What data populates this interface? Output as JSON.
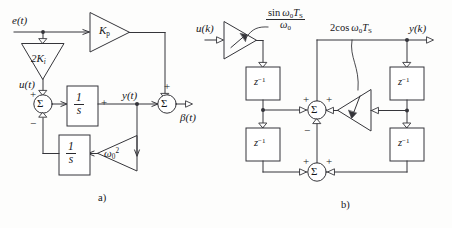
{
  "figure": {
    "caption_a": "a)",
    "caption_b": "b)"
  },
  "diagram_a": {
    "title": "Continuous-time resonant controller block diagram",
    "inputs": [
      {
        "name": "error-input",
        "label": "e(t)"
      }
    ],
    "internal_signals": [
      {
        "name": "u-signal",
        "label": "u(t)"
      },
      {
        "name": "y-signal",
        "label": "y(t)"
      }
    ],
    "outputs": [
      {
        "name": "beta-output",
        "label": "β(t)"
      }
    ],
    "gains": [
      {
        "name": "gain-2ki",
        "label_main": "2K",
        "label_sub": "i",
        "orientation": "down"
      },
      {
        "name": "gain-kp",
        "label_main": "K",
        "label_sub": "p",
        "orientation": "right"
      },
      {
        "name": "gain-omega0-squared",
        "label_main": "ω",
        "label_sub": "0",
        "label_sup": "2",
        "orientation": "left"
      }
    ],
    "blocks": [
      {
        "name": "integrator-forward",
        "num": "1",
        "den": "s"
      },
      {
        "name": "integrator-feedback",
        "num": "1",
        "den": "s"
      }
    ],
    "summing_junctions": [
      {
        "name": "sum-junction-left",
        "symbol": "Σ",
        "signs": {
          "top": "+",
          "bottom": "−"
        }
      },
      {
        "name": "sum-junction-right",
        "symbol": "Σ",
        "signs": {
          "top": "+",
          "left": "+"
        }
      }
    ]
  },
  "diagram_b": {
    "title": "Discrete-time resonant (Goertzel-type) block diagram",
    "inputs": [
      {
        "name": "uk-input",
        "label": "u(k)"
      }
    ],
    "outputs": [
      {
        "name": "yk-output",
        "label": "y(k)"
      }
    ],
    "annotations": [
      {
        "name": "gain-sin-annotation",
        "numerator_sin": "sin",
        "numerator_omega": "ω",
        "numerator_omega_sub": "0",
        "numerator_T": "T",
        "numerator_T_sub": "S",
        "denominator_omega": "ω",
        "denominator_omega_sub": "0"
      },
      {
        "name": "gain-cos-annotation",
        "text_lead": "2cos",
        "text_omega": "ω",
        "text_omega_sub": "0",
        "text_T": "T",
        "text_T_sub": "S"
      }
    ],
    "delay_blocks": [
      {
        "name": "delay-left-upper",
        "label_main": "z",
        "label_sup": "−1"
      },
      {
        "name": "delay-left-lower",
        "label_main": "z",
        "label_sup": "−1"
      },
      {
        "name": "delay-right-upper",
        "label_main": "z",
        "label_sup": "−1"
      },
      {
        "name": "delay-right-lower",
        "label_main": "z",
        "label_sup": "−1"
      }
    ],
    "gains": [
      {
        "name": "gain-input-sin",
        "orientation": "right",
        "variable": true
      },
      {
        "name": "gain-feedback-cos",
        "orientation": "left",
        "variable": true
      }
    ],
    "summing_junctions": [
      {
        "name": "sum-junction-upper",
        "symbol": "Σ",
        "signs": {
          "left": "+",
          "right": "+",
          "bottom": "−"
        }
      },
      {
        "name": "sum-junction-lower",
        "symbol": "Σ",
        "signs": {
          "left": "+",
          "right": "+"
        }
      }
    ]
  },
  "colors": {
    "line": "#35353a",
    "text": "#16161a",
    "background": "#fdfdfc"
  }
}
